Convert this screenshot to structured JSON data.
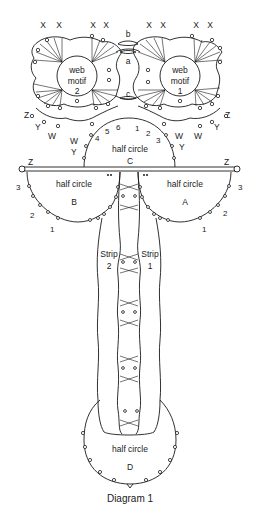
{
  "diagram": {
    "caption": "Diagram 1",
    "top_x_labels": [
      "X",
      "X",
      "X",
      "X",
      "X",
      "X",
      "X",
      "X"
    ],
    "joins": {
      "a": "a",
      "b": "b",
      "c": "c"
    },
    "web_motif_2": {
      "line1": "web",
      "line2": "motif",
      "line3": "2"
    },
    "web_motif_1": {
      "line1": "web",
      "line2": "motif",
      "line3": "1"
    },
    "side_labels": {
      "z_left": "Z",
      "z_right": "Z",
      "y_left": "Y",
      "y_right": "Y",
      "w_left": "W",
      "w_right": "W",
      "w_inner_left": "W",
      "w_inner_right": "W",
      "y_inner_left": "Y",
      "y_inner_right": "Y",
      "z_bar_left": "Z",
      "z_bar_right": "Z"
    },
    "half_circle_c": {
      "title": "half circle",
      "letter": "C",
      "numbers": [
        "4",
        "5",
        "6",
        "1",
        "2",
        "3"
      ]
    },
    "half_circle_b": {
      "title": "half circle",
      "letter": "B",
      "numbers": [
        "3",
        "2",
        "1"
      ]
    },
    "half_circle_a": {
      "title": "half circle",
      "letter": "A",
      "numbers": [
        "3",
        "2",
        "1"
      ]
    },
    "strip_2": {
      "title": "Strip",
      "number": "2"
    },
    "strip_1": {
      "title": "Strip",
      "number": "1"
    },
    "half_circle_d": {
      "title": "half circle",
      "letter": "D"
    }
  }
}
